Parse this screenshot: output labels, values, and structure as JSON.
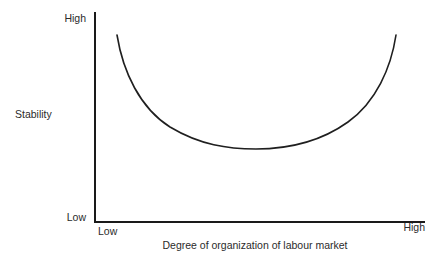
{
  "chart_data": {
    "type": "line",
    "title": "",
    "subtitle": "",
    "xlabel": "Degree of organization of labour market",
    "ylabel": "Stability",
    "x_tick_labels": [
      "Low",
      "High"
    ],
    "y_tick_labels": [
      "Low",
      "High"
    ],
    "xlim": [
      0,
      1
    ],
    "ylim": [
      0,
      1
    ],
    "grid": false,
    "legend": null,
    "annotations": [],
    "series": [
      {
        "name": "Stability vs degree of organization",
        "shape": "u-curve",
        "x": [
          0.07,
          0.12,
          0.18,
          0.25,
          0.32,
          0.4,
          0.48,
          0.56,
          0.64,
          0.72,
          0.8,
          0.86,
          0.91,
          0.95
        ],
        "y": [
          0.89,
          0.76,
          0.63,
          0.52,
          0.44,
          0.39,
          0.36,
          0.36,
          0.38,
          0.44,
          0.55,
          0.67,
          0.8,
          0.89
        ],
        "minimum_at_x": 0.52,
        "minimum_y": 0.36
      }
    ],
    "curve_path": "M 117 35 C 123 72, 140 108, 170 127 C 200 145, 228 149, 256 149 C 288 149, 320 142, 348 122 C 376 102, 391 68, 396 35",
    "colors": {
      "curve": "#1f1f1f",
      "axis": "#1a1a1a",
      "text": "#2b2b2b",
      "background": "#ffffff"
    }
  },
  "axes": {
    "y": {
      "title": "Stability",
      "top_label": "High",
      "bottom_label": "Low"
    },
    "x": {
      "title": "Degree of organization of labour market",
      "left_label": "Low",
      "right_label": "High"
    }
  }
}
